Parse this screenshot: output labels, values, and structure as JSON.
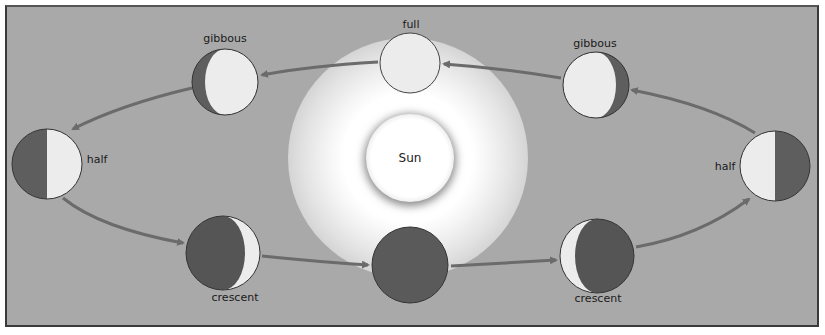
{
  "sun": {
    "label": "Sun"
  },
  "phases": [
    {
      "id": "full",
      "label": "full"
    },
    {
      "id": "gibbous-left",
      "label": "gibbous"
    },
    {
      "id": "half-left",
      "label": "half"
    },
    {
      "id": "crescent-left",
      "label": "crescent"
    },
    {
      "id": "new",
      "label": ""
    },
    {
      "id": "crescent-right",
      "label": "crescent"
    },
    {
      "id": "half-right",
      "label": "half"
    },
    {
      "id": "gibbous-right",
      "label": "gibbous"
    }
  ],
  "colors": {
    "background": "#a9a9a9",
    "moon_light": "#ececec",
    "moon_dark": "#595959",
    "arrow": "#6b6b6b",
    "frame_border": "#3a3a3a"
  }
}
